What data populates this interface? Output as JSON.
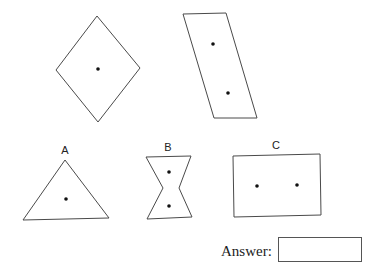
{
  "puzzle": {
    "examples": [
      {
        "shape": "rhombus",
        "dots": 1
      },
      {
        "shape": "parallelogram",
        "dots": 2
      }
    ],
    "options": [
      {
        "label": "A",
        "shape": "triangle",
        "dots": 1
      },
      {
        "label": "B",
        "shape": "hourglass",
        "dots": 2
      },
      {
        "label": "C",
        "shape": "rectangle",
        "dots": 2
      }
    ]
  },
  "answer": {
    "label": "Answer:",
    "value": ""
  },
  "colors": {
    "stroke": "#4a4a4a",
    "dot": "#111111",
    "background": "#ffffff"
  }
}
